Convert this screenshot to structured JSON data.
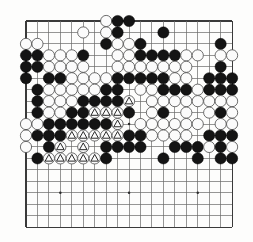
{
  "board": {
    "name": "go-board",
    "size": 19,
    "geometry": {
      "origin_x": 26,
      "origin_y": 21,
      "spacing": 11.45,
      "stone_radius": 5.6
    },
    "colors": {
      "background": "#fdfdfc",
      "grid": "#6a6a6a",
      "edge": "#3a3a3a",
      "black_stone": "#141414",
      "white_stone": "#fbfbfb",
      "white_stone_outline": "#4a4a4a",
      "mark": "#111111"
    },
    "hoshi_points": [
      {
        "col": 4,
        "row": 4
      },
      {
        "col": 10,
        "row": 4
      },
      {
        "col": 16,
        "row": 4
      },
      {
        "col": 4,
        "row": 10
      },
      {
        "col": 10,
        "row": 10
      },
      {
        "col": 16,
        "row": 10
      },
      {
        "col": 4,
        "row": 16
      },
      {
        "col": 10,
        "row": 16
      },
      {
        "col": 16,
        "row": 16
      }
    ],
    "legend": {
      "black": "B",
      "white": "W",
      "empty": ".",
      "marked_white": "w",
      "marked_black": "b"
    },
    "mark_symbol": "triangle",
    "rows": [
      ".......WBB.........",
      ".....W.WB...B......",
      "WW.....BWWB......B.",
      "BBWWWB..WWBBBBWW.WW",
      "BBWWWW..WWWWWWW..B.",
      "B.BBWWWWBBBBBWW.BBB",
      ".BWWWWWBB.WWBBBWBBB",
      ".BWWWBBBBw.WWWWWWWW",
      ".BWWBBwwwB.WB.W.WBW",
      "WWBBBBBBw.WWWWWW.WW",
      "WBBBwwwwwBBWWWW.BBB",
      "W.Bw.w.BBBB..BBBWBW",
      ".BwwwwwB....B..B.BB",
      "...................",
      "...................",
      "...................",
      "...................",
      "...................",
      "..................."
    ]
  },
  "app": {
    "title": "Go board diagram",
    "description": "19x19 Go position with triangle-marked white stones"
  }
}
